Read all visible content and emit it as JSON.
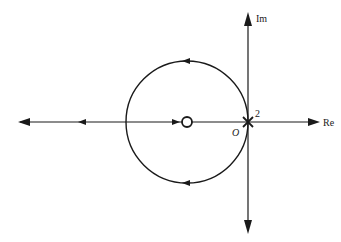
{
  "diagram": {
    "type": "root-locus",
    "axes": {
      "real_label": "Re",
      "imag_label": "Im",
      "origin_label": "O"
    },
    "pole": {
      "symbol": "×",
      "multiplicity_label": "2",
      "position": "origin"
    },
    "zero": {
      "symbol": "○",
      "position": "negative real axis"
    },
    "locus": {
      "circle": "centered at zero, passing through origin",
      "branches": [
        "upper arc (counter-clockwise)",
        "lower arc",
        "real axis to -infinity",
        "real axis toward zero"
      ]
    },
    "colors": {
      "ink": "#1a1a1a",
      "background": "#ffffff"
    }
  }
}
